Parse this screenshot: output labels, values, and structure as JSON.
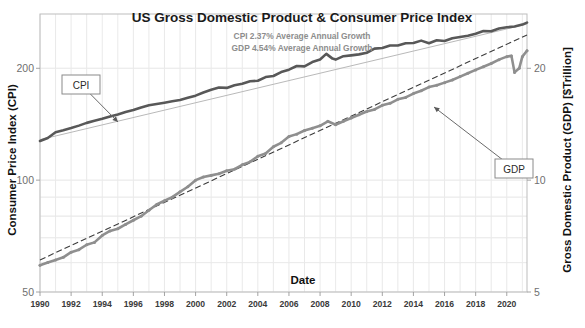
{
  "chart_data": {
    "type": "line",
    "title": "US Gross Domestic Product & Consumer Price Index",
    "subtitles": [
      "CPI 2.37% Average Annual Growth",
      "GDP 4.54% Average Annual Growth"
    ],
    "xlabel": "Date",
    "ylabel_left": "Consumer Price Index (CPI)",
    "ylabel_right": "Gross Domestic Product (GDP) [$Trillion]",
    "xlim": [
      1990,
      2021.3
    ],
    "ylim_left": [
      50,
      280
    ],
    "ylim_right": [
      5,
      28
    ],
    "yscale": "log",
    "grid": true,
    "legend_position": "callout-labels",
    "xticks": [
      1990,
      1992,
      1994,
      1996,
      1998,
      2000,
      2002,
      2004,
      2006,
      2008,
      2010,
      2012,
      2014,
      2016,
      2018,
      2020
    ],
    "yticks_left": [
      50,
      100,
      200
    ],
    "yticks_right": [
      5,
      10,
      20
    ],
    "callouts": [
      {
        "label": "CPI",
        "box_x": 62,
        "box_y": 75,
        "tip_x": 118,
        "tip_y": 122
      },
      {
        "label": "GDP",
        "box_x": 495,
        "box_y": 159,
        "tip_x": 434,
        "tip_y": 107
      }
    ],
    "series": [
      {
        "name": "CPI",
        "axis": "left",
        "color": "#585858",
        "trend": {
          "style": "solid",
          "color": "#b9b9b9",
          "start": 128.5,
          "end": 263.0
        },
        "x": [
          1990,
          1990.5,
          1991,
          1991.5,
          1992,
          1992.5,
          1993,
          1993.5,
          1994,
          1994.5,
          1995,
          1995.5,
          1996,
          1996.5,
          1997,
          1997.5,
          1998,
          1998.5,
          1999,
          1999.5,
          2000,
          2000.5,
          2001,
          2001.5,
          2002,
          2002.5,
          2003,
          2003.5,
          2004,
          2004.5,
          2005,
          2005.5,
          2006,
          2006.5,
          2007,
          2007.5,
          2008,
          2008.4,
          2008.8,
          2009,
          2009.5,
          2010,
          2010.5,
          2011,
          2011.5,
          2012,
          2012.5,
          2013,
          2013.5,
          2014,
          2014.5,
          2015,
          2015.5,
          2016,
          2016.5,
          2017,
          2017.5,
          2018,
          2018.5,
          2019,
          2019.5,
          2020,
          2020.5,
          2021,
          2021.3
        ],
        "values": [
          127.5,
          129.9,
          134.6,
          136.2,
          138.1,
          140.2,
          142.6,
          144.4,
          146.2,
          148.4,
          150.3,
          152.5,
          154.4,
          156.9,
          159.1,
          160.3,
          161.6,
          163.0,
          164.3,
          166.6,
          168.8,
          172.2,
          175.1,
          177.5,
          177.1,
          180.1,
          181.7,
          184.5,
          185.2,
          189.4,
          190.7,
          195.4,
          198.3,
          202.9,
          202.4,
          207.9,
          211.1,
          218.7,
          212.4,
          211.1,
          215.6,
          216.7,
          218.0,
          220.2,
          225.9,
          226.7,
          230.4,
          230.3,
          233.5,
          233.9,
          237.4,
          233.7,
          238.0,
          236.9,
          241.0,
          242.8,
          244.8,
          247.9,
          252.0,
          251.7,
          256.0,
          257.9,
          259.1,
          262.2,
          265.5
        ]
      },
      {
        "name": "GDP",
        "axis": "right",
        "color": "#8f8f8f",
        "trend": {
          "style": "dashed",
          "color": "#3c3c3c",
          "start": 6.1,
          "end": 24.6
        },
        "x": [
          1990,
          1990.5,
          1991,
          1991.5,
          1992,
          1992.5,
          1993,
          1993.5,
          1994,
          1994.5,
          1995,
          1995.5,
          1996,
          1996.5,
          1997,
          1997.5,
          1998,
          1998.5,
          1999,
          1999.5,
          2000,
          2000.5,
          2001,
          2001.5,
          2002,
          2002.5,
          2003,
          2003.5,
          2004,
          2004.5,
          2005,
          2005.5,
          2006,
          2006.5,
          2007,
          2007.5,
          2008,
          2008.5,
          2009,
          2009.5,
          2010,
          2010.5,
          2011,
          2011.5,
          2012,
          2012.5,
          2013,
          2013.5,
          2014,
          2014.5,
          2015,
          2015.5,
          2016,
          2016.5,
          2017,
          2017.5,
          2018,
          2018.5,
          2019,
          2019.5,
          2020,
          2020.3,
          2020.5,
          2020.8,
          2021,
          2021.3
        ],
        "values": [
          5.9,
          6.0,
          6.1,
          6.2,
          6.4,
          6.5,
          6.7,
          6.8,
          7.1,
          7.3,
          7.4,
          7.6,
          7.8,
          8.0,
          8.3,
          8.6,
          8.8,
          9.0,
          9.3,
          9.6,
          10.0,
          10.2,
          10.3,
          10.4,
          10.6,
          10.7,
          11.0,
          11.2,
          11.6,
          11.8,
          12.3,
          12.6,
          13.1,
          13.3,
          13.6,
          13.8,
          14.0,
          14.4,
          14.1,
          14.4,
          14.7,
          15.0,
          15.3,
          15.5,
          15.9,
          16.1,
          16.5,
          16.7,
          17.1,
          17.4,
          17.8,
          18.0,
          18.3,
          18.6,
          19.0,
          19.4,
          19.8,
          20.2,
          20.6,
          21.1,
          21.5,
          21.6,
          19.5,
          20.0,
          21.5,
          22.3
        ]
      }
    ]
  }
}
